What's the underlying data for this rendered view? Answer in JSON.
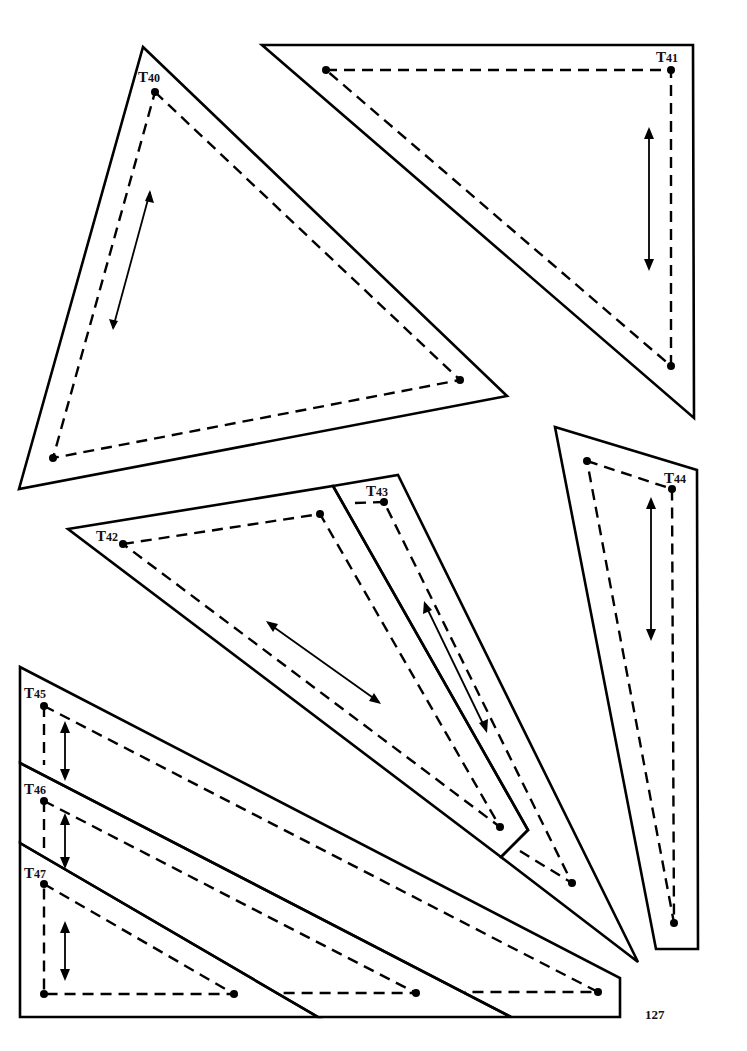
{
  "page": {
    "number": "127"
  },
  "templates": [
    {
      "id": "T40",
      "prefix": "T",
      "num": "40"
    },
    {
      "id": "T41",
      "prefix": "T",
      "num": "41"
    },
    {
      "id": "T42",
      "prefix": "T",
      "num": "42"
    },
    {
      "id": "T43",
      "prefix": "T",
      "num": "43"
    },
    {
      "id": "T44",
      "prefix": "T",
      "num": "44"
    },
    {
      "id": "T45",
      "prefix": "T",
      "num": "45"
    },
    {
      "id": "T46",
      "prefix": "T",
      "num": "46"
    },
    {
      "id": "T47",
      "prefix": "T",
      "num": "47"
    }
  ],
  "legend": {
    "cut_line": "solid",
    "seam_line": "dashed",
    "grain_indicator": "double-arrow",
    "corner_marker": "dot"
  },
  "colors": {
    "ink": "#000000",
    "paper": "#ffffff"
  }
}
